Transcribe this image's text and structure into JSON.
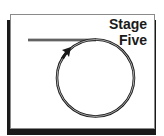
{
  "title": "Stage Five",
  "colors": {
    "stroke": "#1a1a1a",
    "stroke_inner": "#cfcfcf",
    "frame_border": "#8a8a8a",
    "shadow": "#1a1a1a",
    "background": "#ffffff"
  },
  "diagram": {
    "line": {
      "x1": 28,
      "y1": 40,
      "x2": 96,
      "y2": 40
    },
    "circle": {
      "cx": 95.5,
      "cy": 78,
      "r": 38.5
    },
    "arrow": {
      "tip_x": 70,
      "tip_y": 48,
      "direction": "up-right"
    }
  }
}
